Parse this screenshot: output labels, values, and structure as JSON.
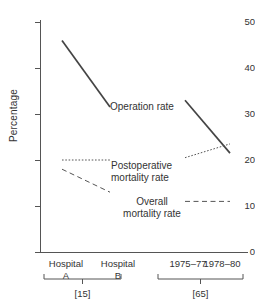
{
  "chart_data": {
    "type": "line",
    "title": "",
    "xlabel": "",
    "ylabel": "Percentage",
    "ylim": [
      0,
      52
    ],
    "yticks": [
      0,
      10,
      20,
      30,
      40,
      50
    ],
    "ytick_labels": [
      "0",
      "10",
      "20",
      "30",
      "40",
      "50"
    ],
    "grid": false,
    "legend": "inline-annotations",
    "panels": [
      {
        "name": "hospital-panel",
        "group_tag": "[15]",
        "categories": [
          "Hospital A",
          "Hospital B"
        ],
        "category_lines": [
          [
            "Hospital",
            "A"
          ],
          [
            "Hospital",
            "B"
          ]
        ]
      },
      {
        "name": "period-panel",
        "group_tag": "[65]",
        "categories": [
          "1975–77",
          "1978–80"
        ],
        "category_lines": [
          [
            "1975–77",
            ""
          ],
          [
            "1978–80",
            ""
          ]
        ]
      }
    ],
    "series": [
      {
        "name": "Operation rate",
        "style": "solid",
        "color": "#444444",
        "panel_values": [
          [
            46.0,
            31.5
          ],
          [
            33.0,
            21.5
          ]
        ]
      },
      {
        "name": "Postoperative mortality rate",
        "style": "dotted",
        "color": "#555555",
        "panel_values": [
          [
            20.0,
            20.0
          ],
          [
            20.5,
            23.5
          ]
        ]
      },
      {
        "name": "Overall mortality rate",
        "style": "dashed",
        "color": "#555555",
        "panel_values": [
          [
            18.0,
            13.0
          ],
          [
            11.0,
            11.0
          ]
        ]
      }
    ],
    "annotations": [
      {
        "id": "operation",
        "text": "Operation rate"
      },
      {
        "id": "postop",
        "text": "Postoperative\nmortality rate"
      },
      {
        "id": "overall",
        "text": "Overall\nmortality rate"
      }
    ]
  },
  "axis": {
    "y_caption": "Percentage"
  }
}
